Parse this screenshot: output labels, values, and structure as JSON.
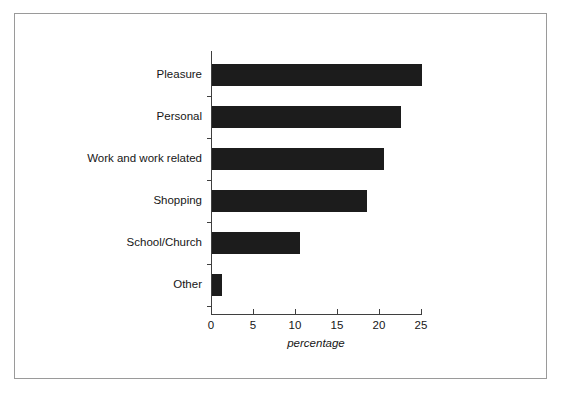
{
  "chart_data": {
    "type": "bar",
    "orientation": "horizontal",
    "title": "",
    "xlabel": "percentage",
    "ylabel": "",
    "categories": [
      "Pleasure",
      "Personal",
      "Work and work related",
      "Shopping",
      "School/Church",
      "Other"
    ],
    "values": [
      25,
      22.5,
      20.5,
      18.5,
      10.5,
      1.2
    ],
    "xlim": [
      0,
      25
    ],
    "xticks": [
      0,
      5,
      10,
      15,
      20,
      25
    ],
    "xtick_labels": [
      "0",
      "5",
      "10",
      "15",
      "20",
      "25"
    ],
    "grid": false,
    "legend": null,
    "bar_color": "#1c1c1c",
    "axis_color": "#3f3f3f",
    "frame_color": "#9a9a9a",
    "background": "#ffffff"
  }
}
